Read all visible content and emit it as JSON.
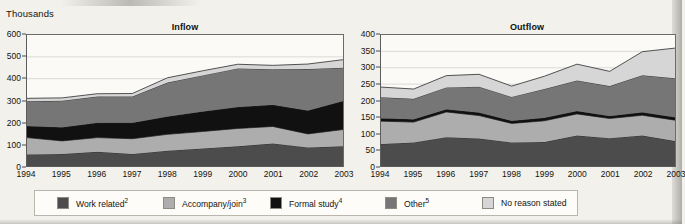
{
  "units_label": "Thousands",
  "legend": {
    "items": [
      {
        "label": "Work related",
        "sup": "2",
        "color": "#4c4c4c",
        "key": "work_related"
      },
      {
        "label": "Accompany/join",
        "sup": "3",
        "color": "#adadad",
        "key": "accompany_join"
      },
      {
        "label": "Formal study",
        "sup": "4",
        "color": "#111111",
        "key": "formal_study"
      },
      {
        "label": "Other",
        "sup": "5",
        "color": "#767676",
        "key": "other"
      },
      {
        "label": "No reason stated",
        "sup": "",
        "color": "#d6d6d6",
        "key": "no_reason_stated"
      }
    ]
  },
  "chart_data": [
    {
      "type": "area",
      "id": "inflow",
      "title": "Inflow",
      "xlabel": "",
      "ylabel": "Thousands",
      "stacked": true,
      "grid": true,
      "legend_position": "bottom",
      "ylim": [
        0,
        600
      ],
      "yticks": [
        0,
        100,
        200,
        300,
        400,
        500,
        600
      ],
      "categories": [
        "1994",
        "1995",
        "1996",
        "1997",
        "1998",
        "1999",
        "2000",
        "2001",
        "2002",
        "2003"
      ],
      "series": [
        {
          "name": "Work related",
          "color": "#4c4c4c",
          "values": [
            53,
            55,
            65,
            55,
            70,
            80,
            90,
            103,
            85,
            90
          ]
        },
        {
          "name": "Accompany/join",
          "color": "#adadad",
          "values": [
            77,
            60,
            65,
            70,
            75,
            78,
            82,
            78,
            62,
            77
          ]
        },
        {
          "name": "Formal study",
          "color": "#111111",
          "values": [
            53,
            62,
            68,
            73,
            82,
            92,
            98,
            99,
            107,
            131
          ]
        },
        {
          "name": "Other",
          "color": "#767676",
          "values": [
            113,
            122,
            120,
            120,
            155,
            165,
            177,
            163,
            190,
            152
          ]
        },
        {
          "name": "No reason stated",
          "color": "#d6d6d6",
          "values": [
            14,
            13,
            13,
            14,
            22,
            21,
            19,
            18,
            23,
            37
          ]
        }
      ],
      "totals": [
        310,
        312,
        331,
        332,
        404,
        436,
        466,
        461,
        467,
        487
      ]
    },
    {
      "type": "area",
      "id": "outflow",
      "title": "Outflow",
      "xlabel": "",
      "ylabel": "Thousands",
      "stacked": true,
      "grid": true,
      "legend_position": "bottom",
      "ylim": [
        0,
        400
      ],
      "yticks": [
        0,
        50,
        100,
        150,
        200,
        250,
        300,
        350,
        400
      ],
      "categories": [
        "1994",
        "1995",
        "1996",
        "1997",
        "1998",
        "1999",
        "2000",
        "2001",
        "2002",
        "2003"
      ],
      "series": [
        {
          "name": "Work related",
          "color": "#4c4c4c",
          "values": [
            67,
            72,
            88,
            84,
            72,
            73,
            93,
            85,
            93,
            76
          ]
        },
        {
          "name": "Accompany/join",
          "color": "#adadad",
          "values": [
            70,
            62,
            77,
            70,
            58,
            65,
            66,
            60,
            62,
            64
          ]
        },
        {
          "name": "Formal study",
          "color": "#111111",
          "values": [
            9,
            9,
            8,
            9,
            8,
            9,
            9,
            8,
            9,
            9
          ]
        },
        {
          "name": "Other",
          "color": "#767676",
          "values": [
            64,
            62,
            67,
            79,
            73,
            88,
            93,
            91,
            113,
            119
          ]
        },
        {
          "name": "No reason stated",
          "color": "#d6d6d6",
          "values": [
            31,
            30,
            36,
            38,
            33,
            39,
            50,
            45,
            72,
            92
          ]
        }
      ],
      "totals": [
        241,
        235,
        276,
        280,
        244,
        274,
        311,
        289,
        349,
        360
      ]
    }
  ]
}
